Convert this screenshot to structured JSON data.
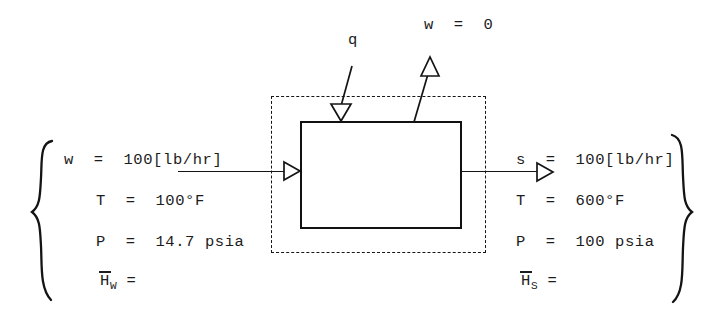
{
  "diagram": {
    "heat_label": "q",
    "work_label": "w  =  0",
    "inlet": {
      "flow": "w  =  100[lb/hr]",
      "temperature": "T  =  100°F",
      "pressure": "P  =  14.7 psia",
      "enthalpy_symbol": "H",
      "enthalpy_subscript": "W",
      "enthalpy_equals": "="
    },
    "outlet": {
      "flow": "s  =  100[lb/hr]",
      "temperature": "T  =  600°F",
      "pressure": "P  =  100 psia",
      "enthalpy_symbol": "H",
      "enthalpy_subscript": "S",
      "enthalpy_equals": "="
    },
    "colors": {
      "ink": "#1a1a1a",
      "background": "#ffffff",
      "box_stroke": "#111111",
      "dashed_stroke": "#161616"
    }
  }
}
